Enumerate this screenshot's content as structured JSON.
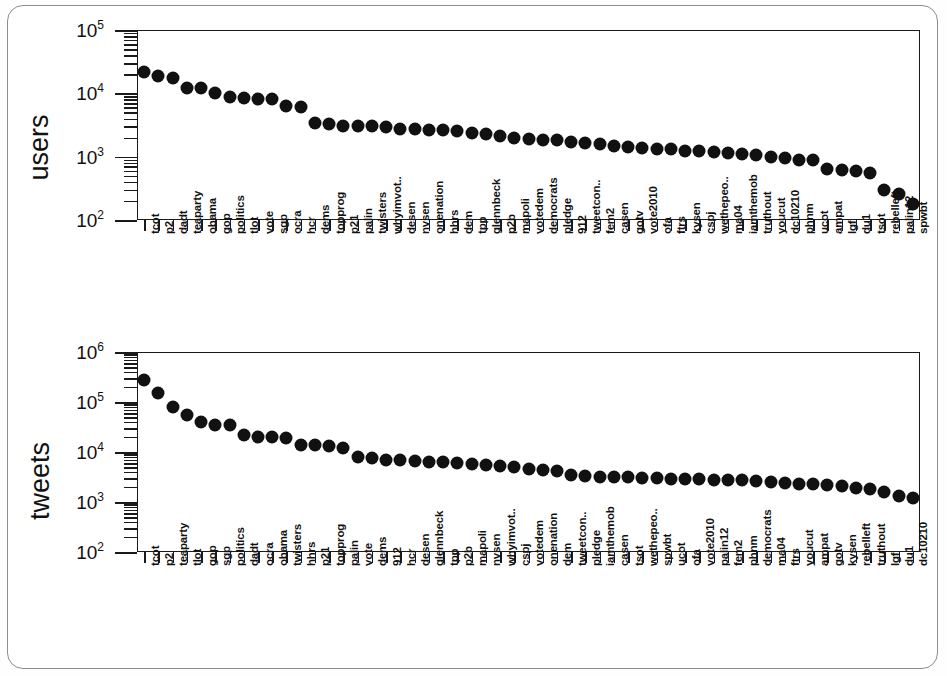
{
  "figure": {
    "panels": [
      "users",
      "tweets"
    ]
  },
  "chart_data": [
    {
      "type": "scatter",
      "title": "",
      "xlabel": "",
      "ylabel": "users",
      "yscale": "log",
      "ylim": [
        100,
        100000
      ],
      "ytick_labels": [
        "10",
        "10",
        "10",
        "10"
      ],
      "ytick_exponents": [
        "2",
        "3",
        "4",
        "5"
      ],
      "ytick_values": [
        100,
        1000,
        10000,
        100000
      ],
      "grid": false,
      "legend": "none",
      "categories": [
        "tcot",
        "p2",
        "dadt",
        "teaparty",
        "obama",
        "gop",
        "politics",
        "tlot",
        "vote",
        "sgp",
        "ocra",
        "hcr",
        "dems",
        "topprog",
        "p21",
        "palin",
        "twisters",
        "whyimvot..",
        "desen",
        "nvsen",
        "onenation",
        "hhrs",
        "dem",
        "tpp",
        "glennbeck",
        "p2b",
        "mapoli",
        "votedem",
        "democrats",
        "pledge",
        "912",
        "tweetcon..",
        "fem2",
        "casen",
        "gotv",
        "vote2010",
        "ofa",
        "ftrs",
        "kysen",
        "cspj",
        "wethepeo..",
        "ma04",
        "iamthemob",
        "truthout",
        "youcut",
        "dc10210",
        "phnm",
        "ucot",
        "ampat",
        "lgf",
        "du1",
        "tsot",
        "rebelleft",
        "palin12",
        "spwbt"
      ],
      "values": [
        22000,
        19000,
        17500,
        12000,
        12000,
        10200,
        8700,
        8300,
        8200,
        8100,
        6200,
        6000,
        3400,
        3300,
        3100,
        3100,
        3000,
        2900,
        2750,
        2700,
        2650,
        2600,
        2500,
        2400,
        2250,
        2100,
        1950,
        1900,
        1850,
        1800,
        1700,
        1650,
        1600,
        1500,
        1400,
        1350,
        1320,
        1300,
        1250,
        1230,
        1200,
        1150,
        1100,
        1050,
        1000,
        950,
        900,
        880,
        640,
        620,
        600,
        560,
        300,
        260,
        180
      ]
    },
    {
      "type": "scatter",
      "title": "",
      "xlabel": "",
      "ylabel": "tweets",
      "yscale": "log",
      "ylim": [
        100,
        1000000
      ],
      "ytick_labels": [
        "10",
        "10",
        "10",
        "10",
        "10"
      ],
      "ytick_exponents": [
        "2",
        "3",
        "4",
        "5",
        "6"
      ],
      "ytick_values": [
        100,
        1000,
        10000,
        100000,
        1000000
      ],
      "grid": false,
      "legend": "none",
      "categories": [
        "tcot",
        "p2",
        "teaparty",
        "tlot",
        "gop",
        "sgp",
        "politics",
        "dadt",
        "ocra",
        "obama",
        "twisters",
        "hhrs",
        "p21",
        "topprog",
        "palin",
        "vote",
        "dems",
        "912",
        "hcr",
        "desen",
        "glennbeck",
        "tpp",
        "p2b",
        "mapoli",
        "nvsen",
        "whyimvot..",
        "cspj",
        "votedem",
        "onenation",
        "dem",
        "tweetcon..",
        "pledge",
        "iamthemob",
        "casen",
        "tsot",
        "wethepeo..",
        "spwbt",
        "ucot",
        "ofa",
        "vote2010",
        "palin12",
        "fem2",
        "phnm",
        "democrats",
        "ma04",
        "ftrs",
        "youcut",
        "ampat",
        "gotv",
        "kysen",
        "rebelleft",
        "truthout",
        "lgf",
        "du1",
        "dc10210"
      ],
      "values": [
        280000,
        150000,
        78000,
        55000,
        40000,
        35000,
        34000,
        22000,
        20000,
        19500,
        19000,
        14000,
        13500,
        13000,
        12000,
        8000,
        7500,
        7000,
        6800,
        6500,
        6300,
        6200,
        6000,
        5800,
        5600,
        5200,
        5000,
        4500,
        4300,
        4200,
        3400,
        3300,
        3200,
        3150,
        3100,
        3050,
        3000,
        2950,
        2900,
        2850,
        2800,
        2750,
        2700,
        2600,
        2500,
        2400,
        2300,
        2250,
        2150,
        2050,
        1900,
        1800,
        1600,
        1300,
        1200
      ]
    }
  ]
}
